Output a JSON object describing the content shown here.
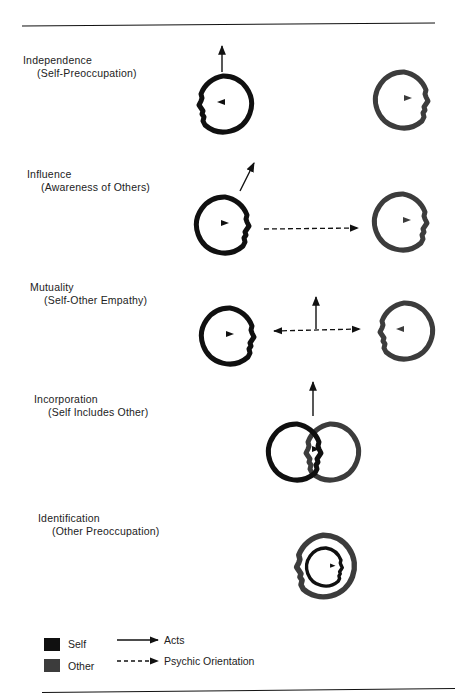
{
  "colors": {
    "self": "#101010",
    "other": "#3c3c3c",
    "ink": "#222222"
  },
  "stages": [
    {
      "title": "Independence",
      "subtitle": "(Self-Preoccupation)"
    },
    {
      "title": "Influence",
      "subtitle": "(Awareness of Others)"
    },
    {
      "title": "Mutuality",
      "subtitle": "(Self-Other Empathy)"
    },
    {
      "title": "Incorporation",
      "subtitle": "(Self Includes Other)"
    },
    {
      "title": "Identification",
      "subtitle": "(Other Preoccupation)"
    }
  ],
  "legend": {
    "self_label": "Self",
    "other_label": "Other",
    "acts_label": "Acts",
    "psychic_label": "Psychic Orientation"
  }
}
